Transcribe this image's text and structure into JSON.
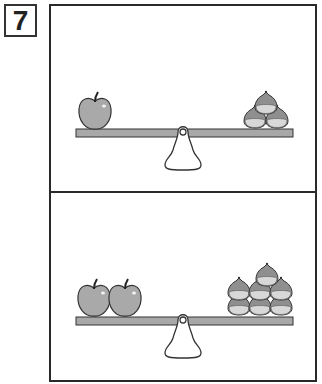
{
  "problem_number": "7",
  "colors": {
    "border": "#2a2a2a",
    "beam_fill": "#a8a8a8",
    "apple_fill": "#a9a9a9",
    "chestnut_fill": "#8f8f8f",
    "chestnut_base": "#d4d4d4",
    "outline": "#333333"
  },
  "panels": [
    {
      "id": "top",
      "left_items": {
        "type": "apple",
        "count": 1
      },
      "right_items": {
        "type": "chestnut",
        "count": 3
      }
    },
    {
      "id": "bottom",
      "left_items": {
        "type": "apple",
        "count": 2
      },
      "right_items": {
        "type": "chestnut",
        "count": 7
      }
    }
  ]
}
